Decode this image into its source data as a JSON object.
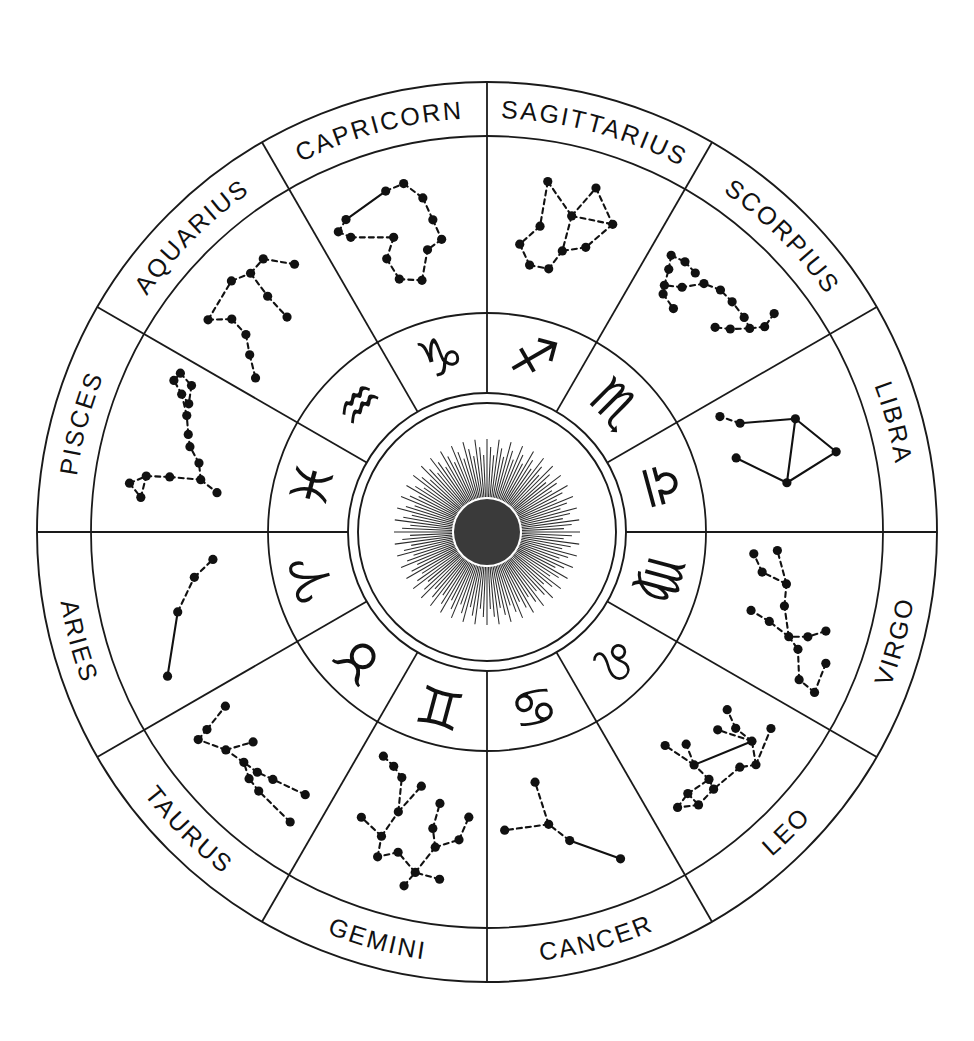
{
  "diagram": {
    "center_icon": "sun-icon",
    "geometry": {
      "cx": 487,
      "cy": 532,
      "r_outer": 450,
      "r_label_inner": 396,
      "r_const_inner": 219,
      "r_glyph_inner": 139,
      "r_sun_outer": 139,
      "r_sun_inner": 129,
      "r_sun_core": 33,
      "ray_count": 144
    },
    "colors": {
      "ink": "#1a1a1a",
      "star": "#111111",
      "sun_core": "#3a3a3a",
      "background": "#ffffff"
    },
    "signs": [
      {
        "name": "SAGITTARIUS",
        "glyph": "♐",
        "glyph_name": "sagittarius-glyph",
        "start_deg": -90,
        "end_deg": -60,
        "mid_deg": -75
      },
      {
        "name": "SCORPIUS",
        "glyph": "♏",
        "glyph_name": "scorpius-glyph",
        "start_deg": -60,
        "end_deg": -30,
        "mid_deg": -45
      },
      {
        "name": "LIBRA",
        "glyph": "♎",
        "glyph_name": "libra-glyph",
        "start_deg": -30,
        "end_deg": 0,
        "mid_deg": -15
      },
      {
        "name": "VIRGO",
        "glyph": "♍",
        "glyph_name": "virgo-glyph",
        "start_deg": 0,
        "end_deg": 30,
        "mid_deg": 15
      },
      {
        "name": "LEO",
        "glyph": "♌",
        "glyph_name": "leo-glyph",
        "start_deg": 30,
        "end_deg": 60,
        "mid_deg": 45
      },
      {
        "name": "CANCER",
        "glyph": "♋",
        "glyph_name": "cancer-glyph",
        "start_deg": 60,
        "end_deg": 90,
        "mid_deg": 75
      },
      {
        "name": "GEMINI",
        "glyph": "♊",
        "glyph_name": "gemini-glyph",
        "start_deg": 90,
        "end_deg": 120,
        "mid_deg": 105
      },
      {
        "name": "TAURUS",
        "glyph": "♉",
        "glyph_name": "taurus-glyph",
        "start_deg": 120,
        "end_deg": 150,
        "mid_deg": 135
      },
      {
        "name": "ARIES",
        "glyph": "♈",
        "glyph_name": "aries-glyph",
        "start_deg": 150,
        "end_deg": 180,
        "mid_deg": 165
      },
      {
        "name": "PISCES",
        "glyph": "♓",
        "glyph_name": "pisces-glyph",
        "start_deg": 180,
        "end_deg": 210,
        "mid_deg": 195
      },
      {
        "name": "AQUARIUS",
        "glyph": "♒",
        "glyph_name": "aquarius-glyph",
        "start_deg": 210,
        "end_deg": 240,
        "mid_deg": 225
      },
      {
        "name": "CAPRICORN",
        "glyph": "♑",
        "glyph_name": "capricorn-glyph",
        "start_deg": 240,
        "end_deg": 270,
        "mid_deg": 255
      }
    ],
    "constellations": {
      "SAGITTARIUS": {
        "stars": [
          [
            0.3,
            0.12
          ],
          [
            0.5,
            0.34
          ],
          [
            0.6,
            0.08
          ],
          [
            0.78,
            0.3
          ],
          [
            0.3,
            0.47
          ],
          [
            0.17,
            0.63
          ],
          [
            0.27,
            0.78
          ],
          [
            0.43,
            0.78
          ],
          [
            0.66,
            0.54
          ],
          [
            0.5,
            0.62
          ]
        ],
        "links": [
          [
            0,
            1
          ],
          [
            1,
            2
          ],
          [
            2,
            3
          ],
          [
            1,
            3
          ],
          [
            0,
            4
          ],
          [
            4,
            5
          ],
          [
            5,
            6
          ],
          [
            6,
            7
          ],
          [
            1,
            9
          ],
          [
            9,
            7
          ],
          [
            3,
            8
          ],
          [
            8,
            9
          ]
        ]
      },
      "SCORPIUS": {
        "stars": [
          [
            0.8,
            0.08
          ],
          [
            0.83,
            0.2
          ],
          [
            0.78,
            0.3
          ],
          [
            0.7,
            0.42
          ],
          [
            0.62,
            0.5
          ],
          [
            0.7,
            0.28
          ],
          [
            0.57,
            0.27
          ],
          [
            0.46,
            0.27
          ],
          [
            0.35,
            0.32
          ],
          [
            0.25,
            0.45
          ],
          [
            0.14,
            0.52
          ],
          [
            0.1,
            0.4
          ],
          [
            0.06,
            0.3
          ],
          [
            0.16,
            0.28
          ],
          [
            0.26,
            0.3
          ],
          [
            0.17,
            0.58
          ],
          [
            0.3,
            0.62
          ]
        ],
        "links": [
          [
            0,
            1
          ],
          [
            1,
            2
          ],
          [
            2,
            3
          ],
          [
            3,
            4
          ],
          [
            2,
            5
          ],
          [
            5,
            6
          ],
          [
            6,
            7
          ],
          [
            7,
            8
          ],
          [
            8,
            9
          ],
          [
            9,
            10
          ],
          [
            10,
            11
          ],
          [
            11,
            12
          ],
          [
            12,
            13
          ],
          [
            13,
            14
          ],
          [
            10,
            15
          ],
          [
            15,
            16
          ]
        ]
      },
      "LIBRA": {
        "stars": [
          [
            0.58,
            0.1
          ],
          [
            0.3,
            0.33
          ],
          [
            0.72,
            0.52
          ],
          [
            0.18,
            0.74
          ],
          [
            0.06,
            0.86
          ],
          [
            0.44,
            0.86
          ]
        ],
        "links": [
          [
            0,
            1
          ],
          [
            0,
            2
          ],
          [
            1,
            2
          ],
          [
            1,
            3
          ],
          [
            3,
            4
          ],
          [
            2,
            5
          ]
        ]
      },
      "VIRGO": {
        "stars": [
          [
            0.74,
            0.06
          ],
          [
            0.93,
            0.05
          ],
          [
            0.9,
            0.2
          ],
          [
            0.72,
            0.3
          ],
          [
            0.55,
            0.14
          ],
          [
            0.62,
            0.26
          ],
          [
            0.66,
            0.4
          ],
          [
            0.46,
            0.5
          ],
          [
            0.3,
            0.52
          ],
          [
            0.06,
            0.62
          ],
          [
            0.24,
            0.72
          ],
          [
            0.1,
            0.8
          ],
          [
            0.6,
            0.58
          ],
          [
            0.56,
            0.74
          ]
        ],
        "links": [
          [
            0,
            1
          ],
          [
            1,
            2
          ],
          [
            2,
            3
          ],
          [
            4,
            5
          ],
          [
            5,
            6
          ],
          [
            6,
            3
          ],
          [
            6,
            7
          ],
          [
            7,
            8
          ],
          [
            8,
            9
          ],
          [
            8,
            10
          ],
          [
            10,
            11
          ],
          [
            6,
            12
          ],
          [
            12,
            13
          ]
        ]
      },
      "LEO": {
        "stars": [
          [
            0.34,
            0.12
          ],
          [
            0.1,
            0.2
          ],
          [
            0.24,
            0.26
          ],
          [
            0.42,
            0.2
          ],
          [
            0.64,
            0.22
          ],
          [
            0.78,
            0.2
          ],
          [
            0.9,
            0.28
          ],
          [
            0.79,
            0.32
          ],
          [
            0.62,
            0.3
          ],
          [
            0.24,
            0.42
          ],
          [
            0.17,
            0.56
          ],
          [
            0.33,
            0.52
          ],
          [
            0.63,
            0.46
          ],
          [
            0.57,
            0.62
          ],
          [
            0.7,
            0.72
          ]
        ],
        "links": [
          [
            0,
            1
          ],
          [
            0,
            2
          ],
          [
            0,
            3
          ],
          [
            3,
            4
          ],
          [
            4,
            5
          ],
          [
            5,
            6
          ],
          [
            6,
            7
          ],
          [
            7,
            5
          ],
          [
            7,
            8
          ],
          [
            8,
            4
          ],
          [
            2,
            9
          ],
          [
            9,
            10
          ],
          [
            2,
            11
          ],
          [
            2,
            12
          ],
          [
            8,
            12
          ],
          [
            12,
            13
          ],
          [
            12,
            14
          ]
        ]
      },
      "CANCER": {
        "stars": [
          [
            0.22,
            0.14
          ],
          [
            0.5,
            0.4
          ],
          [
            0.62,
            0.56
          ],
          [
            0.95,
            0.56
          ],
          [
            0.66,
            0.9
          ]
        ],
        "links": [
          [
            0,
            1
          ],
          [
            1,
            2
          ],
          [
            2,
            3
          ],
          [
            2,
            4
          ]
        ]
      },
      "GEMINI": {
        "stars": [
          [
            0.43,
            0.06
          ],
          [
            0.22,
            0.16
          ],
          [
            0.38,
            0.18
          ],
          [
            0.52,
            0.3
          ],
          [
            0.64,
            0.22
          ],
          [
            0.66,
            0.38
          ],
          [
            0.84,
            0.46
          ],
          [
            0.28,
            0.4
          ],
          [
            0.12,
            0.48
          ],
          [
            0.06,
            0.66
          ],
          [
            0.32,
            0.54
          ],
          [
            0.3,
            0.74
          ],
          [
            0.6,
            0.6
          ],
          [
            0.48,
            0.84
          ],
          [
            0.66,
            0.86
          ],
          [
            0.76,
            0.92
          ],
          [
            0.88,
            0.96
          ]
        ],
        "links": [
          [
            0,
            2
          ],
          [
            1,
            2
          ],
          [
            2,
            3
          ],
          [
            3,
            4
          ],
          [
            4,
            5
          ],
          [
            5,
            6
          ],
          [
            2,
            7
          ],
          [
            7,
            8
          ],
          [
            8,
            9
          ],
          [
            7,
            10
          ],
          [
            10,
            11
          ],
          [
            5,
            12
          ],
          [
            12,
            13
          ],
          [
            12,
            14
          ],
          [
            14,
            15
          ],
          [
            15,
            16
          ]
        ]
      },
      "TAURUS": {
        "stars": [
          [
            0.08,
            0.16
          ],
          [
            0.36,
            0.2
          ],
          [
            0.46,
            0.22
          ],
          [
            0.56,
            0.28
          ],
          [
            0.1,
            0.4
          ],
          [
            0.34,
            0.34
          ],
          [
            0.45,
            0.3
          ],
          [
            0.7,
            0.24
          ],
          [
            0.86,
            0.12
          ],
          [
            0.88,
            0.22
          ],
          [
            0.62,
            0.44
          ],
          [
            0.94,
            0.44
          ]
        ],
        "links": [
          [
            0,
            1
          ],
          [
            1,
            2
          ],
          [
            2,
            3
          ],
          [
            4,
            5
          ],
          [
            5,
            6
          ],
          [
            6,
            3
          ],
          [
            3,
            7
          ],
          [
            7,
            8
          ],
          [
            8,
            9
          ],
          [
            7,
            10
          ],
          [
            9,
            11
          ]
        ]
      },
      "ARIES": {
        "stars": [
          [
            0.14,
            0.16
          ],
          [
            0.52,
            0.4
          ],
          [
            0.74,
            0.58
          ],
          [
            0.86,
            0.74
          ]
        ],
        "links": [
          [
            0,
            1
          ],
          [
            1,
            2
          ],
          [
            2,
            3
          ]
        ]
      },
      "PISCES": {
        "stars": [
          [
            0.22,
            0.08
          ],
          [
            0.14,
            0.18
          ],
          [
            0.28,
            0.2
          ],
          [
            0.3,
            0.38
          ],
          [
            0.32,
            0.62
          ],
          [
            0.24,
            0.76
          ],
          [
            0.44,
            0.58
          ],
          [
            0.54,
            0.48
          ],
          [
            0.62,
            0.44
          ],
          [
            0.74,
            0.38
          ],
          [
            0.86,
            0.28
          ],
          [
            0.92,
            0.18
          ],
          [
            0.98,
            0.2
          ],
          [
            0.94,
            0.32
          ],
          [
            0.82,
            0.36
          ]
        ],
        "links": [
          [
            0,
            1
          ],
          [
            1,
            2
          ],
          [
            0,
            2
          ],
          [
            2,
            3
          ],
          [
            3,
            4
          ],
          [
            4,
            5
          ],
          [
            4,
            6
          ],
          [
            6,
            7
          ],
          [
            7,
            8
          ],
          [
            8,
            9
          ],
          [
            9,
            10
          ],
          [
            10,
            11
          ],
          [
            11,
            12
          ],
          [
            12,
            13
          ],
          [
            13,
            14
          ],
          [
            14,
            10
          ]
        ]
      },
      "AQUARIUS": {
        "stars": [
          [
            0.2,
            0.16
          ],
          [
            0.3,
            0.3
          ],
          [
            0.28,
            0.46
          ],
          [
            0.18,
            0.58
          ],
          [
            0.06,
            0.72
          ],
          [
            0.48,
            0.1
          ],
          [
            0.6,
            0.16
          ],
          [
            0.72,
            0.14
          ],
          [
            0.58,
            0.38
          ],
          [
            0.58,
            0.6
          ],
          [
            0.86,
            0.32
          ]
        ],
        "links": [
          [
            0,
            1
          ],
          [
            1,
            2
          ],
          [
            2,
            3
          ],
          [
            3,
            4
          ],
          [
            0,
            5
          ],
          [
            5,
            6
          ],
          [
            6,
            7
          ],
          [
            6,
            8
          ],
          [
            8,
            9
          ],
          [
            7,
            10
          ]
        ]
      },
      "CAPRICORN": {
        "stars": [
          [
            0.06,
            0.28
          ],
          [
            0.14,
            0.22
          ],
          [
            0.12,
            0.36
          ],
          [
            0.44,
            0.12
          ],
          [
            0.56,
            0.1
          ],
          [
            0.66,
            0.24
          ],
          [
            0.7,
            0.42
          ],
          [
            0.74,
            0.58
          ],
          [
            0.62,
            0.64
          ],
          [
            0.4,
            0.48
          ],
          [
            0.3,
            0.62
          ],
          [
            0.34,
            0.8
          ],
          [
            0.52,
            0.86
          ]
        ],
        "links": [
          [
            0,
            1
          ],
          [
            0,
            2
          ],
          [
            1,
            3
          ],
          [
            3,
            4
          ],
          [
            4,
            5
          ],
          [
            5,
            6
          ],
          [
            6,
            7
          ],
          [
            7,
            8
          ],
          [
            2,
            9
          ],
          [
            9,
            10
          ],
          [
            10,
            11
          ],
          [
            11,
            12
          ],
          [
            12,
            8
          ]
        ]
      }
    }
  }
}
